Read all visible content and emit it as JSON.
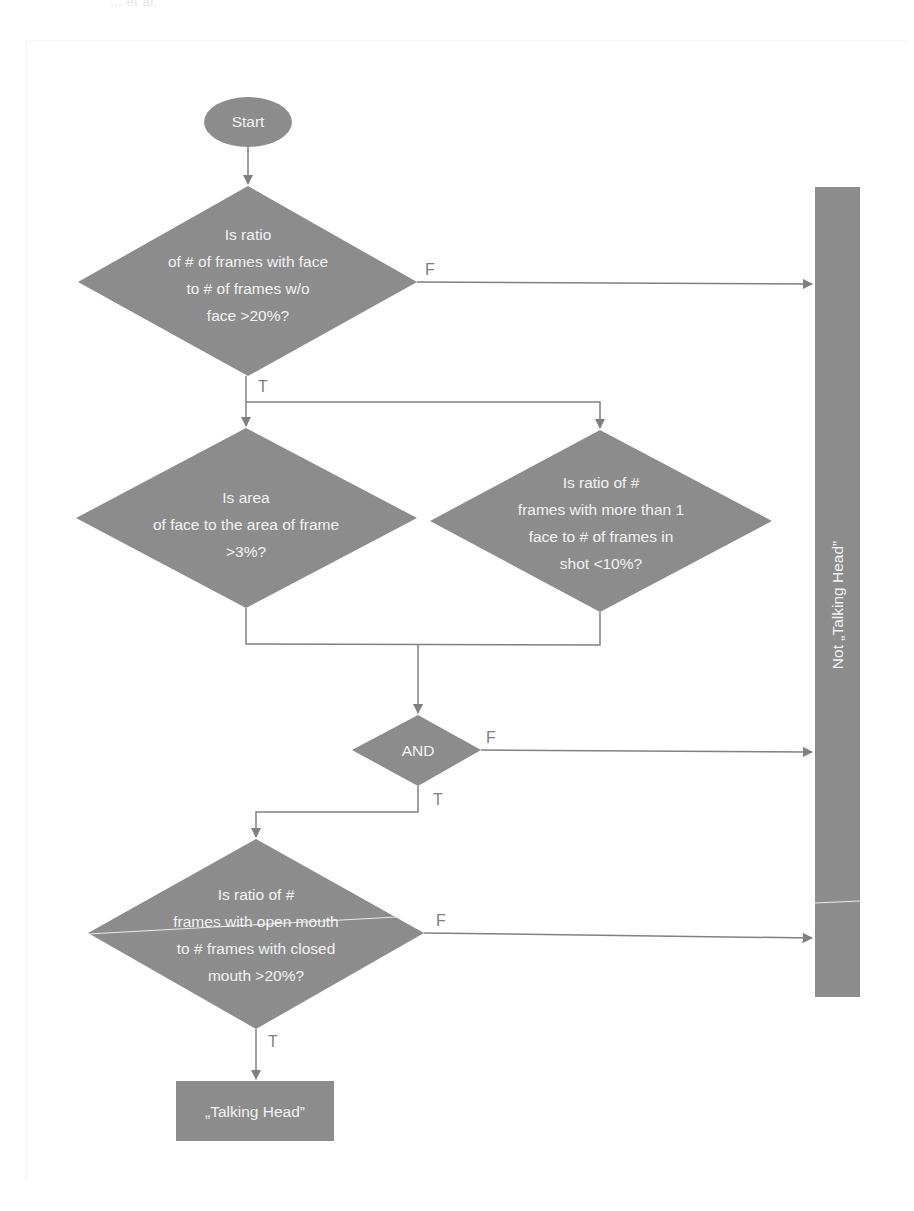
{
  "header": {
    "running_header": "... et al."
  },
  "colors": {
    "shape_fill": "#8c8c8c",
    "line": "#808080",
    "text_on_shape": "#f2f2f2",
    "label": "#7f7f7f",
    "background": "#ffffff"
  },
  "nodes": {
    "start": {
      "label": "Start"
    },
    "decision1": {
      "lines": [
        "Is ratio",
        "of # of frames with face",
        "to # of frames w/o",
        "face >20%?"
      ]
    },
    "decision2": {
      "lines": [
        "Is area",
        "of face to the area of frame",
        ">3%?"
      ]
    },
    "decision3": {
      "lines": [
        "Is ratio of #",
        "frames with more than 1",
        "face to # of frames in",
        "shot <10%?"
      ]
    },
    "and_gate": {
      "label": "AND"
    },
    "decision4": {
      "lines": [
        "Is ratio of #",
        "frames with open mouth",
        "to # frames with closed",
        "mouth >20%?"
      ]
    },
    "talking_head": {
      "label": "„Talking Head”"
    },
    "not_talking_head": {
      "label": "Not „Talking Head”"
    }
  },
  "edges": {
    "d1_false": "F",
    "d1_true": "T",
    "and_false": "F",
    "and_true": "T",
    "d4_false": "F",
    "d4_true": "T"
  }
}
